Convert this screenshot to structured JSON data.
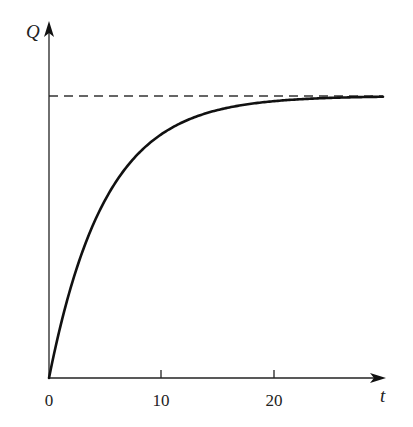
{
  "chart_data": {
    "type": "line",
    "title": "",
    "xlabel": "t",
    "ylabel": "Q",
    "x_ticks": [
      0,
      10,
      20
    ],
    "x_tick_labels": [
      "0",
      "10",
      "20"
    ],
    "y_ticks": [],
    "xlim": [
      0,
      30
    ],
    "ylim": [
      0,
      1.1
    ],
    "grid": false,
    "legend": null,
    "series": [
      {
        "name": "Q(t)",
        "style": "solid",
        "function": "Q = Qmax * (1 - exp(-t/5))",
        "x": [
          0,
          1,
          2,
          3,
          4,
          5,
          6,
          8,
          10,
          12,
          15,
          18,
          20,
          22,
          25,
          30
        ],
        "values": [
          0,
          0.181,
          0.33,
          0.451,
          0.551,
          0.632,
          0.699,
          0.798,
          0.865,
          0.909,
          0.95,
          0.973,
          0.982,
          0.988,
          0.993,
          0.998
        ]
      },
      {
        "name": "asymptote",
        "style": "dashed",
        "x": [
          0,
          30
        ],
        "values": [
          1,
          1
        ]
      }
    ],
    "annotations": [
      "Horizontal dashed asymptote at Q = Qmax"
    ]
  },
  "axes": {
    "x_label": "t",
    "y_label": "Q",
    "tick_labels": [
      "0",
      "10",
      "20"
    ]
  }
}
